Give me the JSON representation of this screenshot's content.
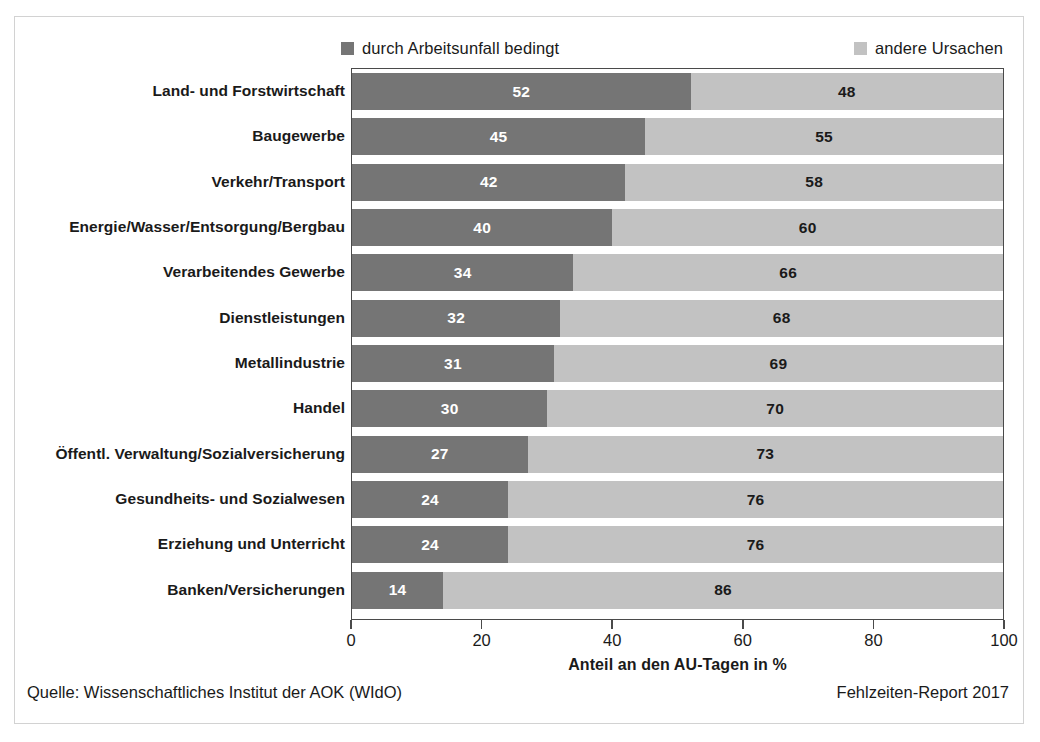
{
  "legend": {
    "entries": [
      {
        "label": "durch Arbeitsunfall bedingt",
        "color": "#757575",
        "swatch": "legend-swatch-dark"
      },
      {
        "label": "andere Ursachen",
        "color": "#c2c2c2",
        "swatch": "legend-swatch-light"
      }
    ]
  },
  "footer": {
    "source": "Quelle: Wissenschaftliches Institut der AOK (WIdO)",
    "report": "Fehlzeiten-Report 2017"
  },
  "chart_data": {
    "type": "bar",
    "orientation": "horizontal",
    "stacked": true,
    "normalized": true,
    "title": "",
    "xlabel": "Anteil an den AU-Tagen in %",
    "ylabel": "",
    "xlim": [
      0,
      100
    ],
    "xticks": [
      0,
      20,
      40,
      60,
      80,
      100
    ],
    "xtick_labels": [
      "0",
      "20",
      "40",
      "60",
      "80",
      "100"
    ],
    "grid": false,
    "legend_position": "top",
    "categories": [
      "Land- und Forstwirtschaft",
      "Baugewerbe",
      "Verkehr/Transport",
      "Energie/Wasser/Entsorgung/Bergbau",
      "Verarbeitendes Gewerbe",
      "Dienstleistungen",
      "Metallindustrie",
      "Handel",
      "Öffentl. Verwaltung/Sozialversicherung",
      "Gesundheits- und Sozialwesen",
      "Erziehung und Unterricht",
      "Banken/Versicherungen"
    ],
    "series": [
      {
        "name": "durch Arbeitsunfall bedingt",
        "color": "#757575",
        "values": [
          52,
          45,
          42,
          40,
          34,
          32,
          31,
          30,
          27,
          24,
          24,
          14
        ]
      },
      {
        "name": "andere Ursachen",
        "color": "#c2c2c2",
        "values": [
          48,
          55,
          58,
          60,
          66,
          68,
          69,
          70,
          73,
          76,
          76,
          86
        ]
      }
    ]
  }
}
